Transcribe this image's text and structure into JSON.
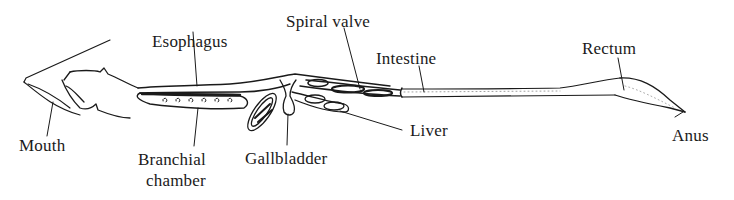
{
  "diagram": {
    "type": "anatomical-digestive-tract",
    "stroke_color": "#1a1a1a",
    "background": "#ffffff",
    "labels": {
      "esophagus": "Esophagus",
      "spiral_valve": "Spiral valve",
      "intestine": "Intestine",
      "rectum": "Rectum",
      "mouth": "Mouth",
      "branchial_chamber_line1": "Branchial",
      "branchial_chamber_line2": "chamber",
      "gallbladder": "Gallbladder",
      "liver": "Liver",
      "anus": "Anus"
    }
  }
}
